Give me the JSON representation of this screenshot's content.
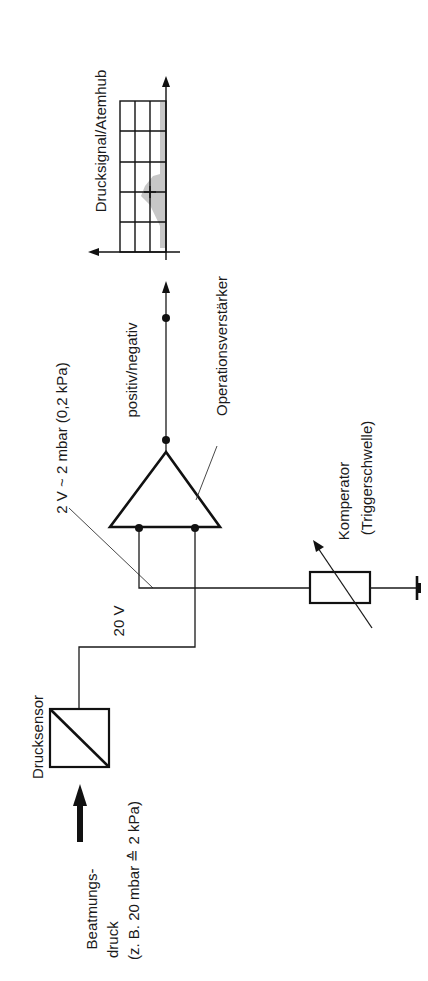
{
  "diagram": {
    "orientation": "rotated-90-ccw",
    "labels": {
      "output_chart": "Drucksignal/Atemhub",
      "signal_polarity": "positiv/negativ",
      "opamp": "Operationsverstärker",
      "gain": "2 V ~ 2 mbar (0,2 kPa)",
      "supply": "20 V",
      "comparator_line1": "Komperator",
      "comparator_line2": "(Triggerschwelle)",
      "sensor": "Drucksensor",
      "input_line1": "Beatmungs-",
      "input_line2": "druck",
      "input_line3": "(z. B. 20 mbar ≙ 2 kPa)"
    },
    "components": [
      {
        "id": "pressure-input",
        "type": "arrow",
        "label": "Beatmungsdruck"
      },
      {
        "id": "pressure-sensor",
        "type": "sensor-box",
        "label": "Drucksensor"
      },
      {
        "id": "opamp",
        "type": "triangle",
        "label": "Operationsverstärker"
      },
      {
        "id": "comparator",
        "type": "variable-resistor",
        "label": "Komperator (Triggerschwelle)"
      },
      {
        "id": "ground",
        "type": "ground"
      },
      {
        "id": "output-chart",
        "type": "grid-chart",
        "label": "Drucksignal/Atemhub",
        "rows": 5,
        "cols": 3
      }
    ],
    "colors": {
      "ink": "#111111",
      "shade": "#bdbdbd",
      "background": "#ffffff"
    }
  }
}
